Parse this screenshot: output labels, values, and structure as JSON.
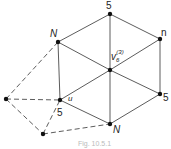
{
  "diagram": {
    "type": "graph",
    "nodes": [
      {
        "id": "top5",
        "x": 110,
        "y": 14,
        "label": "5",
        "lx": 106,
        "ly": 9
      },
      {
        "id": "n",
        "x": 160,
        "y": 39,
        "label": "n",
        "lx": 161,
        "ly": 36
      },
      {
        "id": "center",
        "x": 110,
        "y": 70,
        "label": "v",
        "sub": "6",
        "sup": "(3)",
        "lx": 111,
        "ly": 60
      },
      {
        "id": "Nupper",
        "x": 58,
        "y": 42,
        "label": "N",
        "lx": 50,
        "ly": 37
      },
      {
        "id": "u",
        "x": 60,
        "y": 100,
        "label": "u",
        "label2": "5",
        "lx": 68,
        "ly": 101,
        "l2x": 57,
        "l2y": 116
      },
      {
        "id": "right5",
        "x": 160,
        "y": 94,
        "label": "5",
        "lx": 163,
        "ly": 101
      },
      {
        "id": "Nbottom",
        "x": 110,
        "y": 124,
        "label": "N",
        "lx": 113,
        "ly": 133
      },
      {
        "id": "farleft",
        "x": 6,
        "y": 99,
        "label": ""
      },
      {
        "id": "bottomleft",
        "x": 43,
        "y": 134,
        "label": ""
      }
    ],
    "solid_edges": [
      [
        "top5",
        "n"
      ],
      [
        "top5",
        "Nupper"
      ],
      [
        "top5",
        "center"
      ],
      [
        "n",
        "center"
      ],
      [
        "n",
        "right5"
      ],
      [
        "Nupper",
        "center"
      ],
      [
        "Nupper",
        "u"
      ],
      [
        "center",
        "u"
      ],
      [
        "center",
        "right5"
      ],
      [
        "center",
        "Nbottom"
      ],
      [
        "u",
        "Nbottom"
      ],
      [
        "right5",
        "Nbottom"
      ]
    ],
    "dashed_edges": [
      [
        "farleft",
        "Nupper"
      ],
      [
        "farleft",
        "u"
      ],
      [
        "farleft",
        "bottomleft"
      ],
      [
        "bottomleft",
        "u"
      ],
      [
        "bottomleft",
        "Nbottom"
      ]
    ],
    "caption": "Fig. 10.5.1"
  }
}
